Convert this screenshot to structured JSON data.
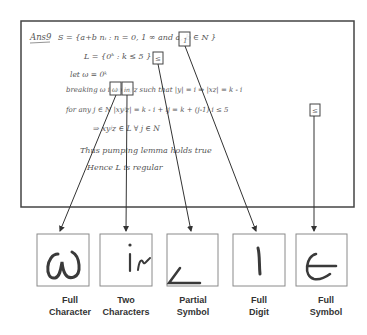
{
  "document": {
    "lines": [
      {
        "text": "Ans9",
        "x": 30,
        "y": 40,
        "size": 8.5,
        "underline": true
      },
      {
        "text": "S = {a+b nᵢ :  n = 0, 1   ∞ and  a, b ∈ N }",
        "x": 58,
        "y": 40,
        "size": 8
      },
      {
        "text": "L = {0ᵏ :  k ≤ 5 }",
        "x": 84,
        "y": 59,
        "size": 8
      },
      {
        "text": "let  ω = 0ᵏ",
        "x": 70,
        "y": 77,
        "size": 7.5
      },
      {
        "text": "breaking  ω   iₙ  to  xyⁱz   such  that  |y| = i  ⇒  |xz| = k - i",
        "x": 66,
        "y": 92,
        "size": 7.5
      },
      {
        "text": "for any  j ∈ N       |xyʲz| = k - i + ij  =  k + (j-1) i ≤ 5",
        "x": 66,
        "y": 112,
        "size": 7.5
      },
      {
        "text": "⇒  xyʲz ∈ L   ∀  j ∈ N",
        "x": 93,
        "y": 131,
        "size": 7.5
      },
      {
        "text": "Thus  pumping  lemma  holds  true",
        "x": 80,
        "y": 153,
        "size": 8
      },
      {
        "text": "Hence  L  is  regular",
        "x": 87,
        "y": 170,
        "size": 8
      }
    ]
  },
  "highlights": [
    {
      "name": "highlight-omega",
      "x": 110,
      "y": 82,
      "w": 11,
      "h": 13
    },
    {
      "name": "highlight-in",
      "x": 122,
      "y": 82,
      "w": 11,
      "h": 13
    },
    {
      "name": "highlight-leq-1",
      "x": 153,
      "y": 52,
      "w": 10,
      "h": 12
    },
    {
      "name": "highlight-one",
      "x": 179,
      "y": 32,
      "w": 11,
      "h": 14
    },
    {
      "name": "highlight-leq-2",
      "x": 310,
      "y": 104,
      "w": 10,
      "h": 12
    }
  ],
  "crops": [
    {
      "glyph": "ω",
      "label_line1": "Full",
      "label_line2": "Character",
      "x": 37
    },
    {
      "glyph": "in",
      "label_line1": "Two",
      "label_line2": "Characters",
      "x": 100
    },
    {
      "glyph": "≤",
      "label_line1": "Partial",
      "label_line2": "Symbol",
      "x": 167
    },
    {
      "glyph": "1",
      "label_line1": "Full",
      "label_line2": "Digit",
      "x": 233
    },
    {
      "glyph": "∈",
      "label_line1": "Full",
      "label_line2": "Symbol",
      "x": 296
    }
  ],
  "labels": {
    "c0": {
      "l1": "Full",
      "l2": "Character"
    },
    "c1": {
      "l1": "Two",
      "l2": "Characters"
    },
    "c2": {
      "l1": "Partial",
      "l2": "Symbol"
    },
    "c3": {
      "l1": "Full",
      "l2": "Digit"
    },
    "c4": {
      "l1": "Full",
      "l2": "Symbol"
    }
  },
  "colors": {
    "frame": "#444444",
    "ink": "#555555",
    "crop_border": "#8a8a8a",
    "stroke": "#3a3a3a"
  }
}
